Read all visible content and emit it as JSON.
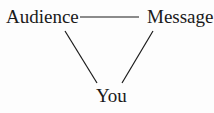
{
  "diagram": {
    "type": "triangle",
    "nodes": [
      {
        "id": "audience",
        "label": "Audience"
      },
      {
        "id": "message",
        "label": "Message"
      },
      {
        "id": "you",
        "label": "You"
      }
    ],
    "edges": [
      {
        "from": "audience",
        "to": "message"
      },
      {
        "from": "audience",
        "to": "you"
      },
      {
        "from": "message",
        "to": "you"
      }
    ]
  }
}
